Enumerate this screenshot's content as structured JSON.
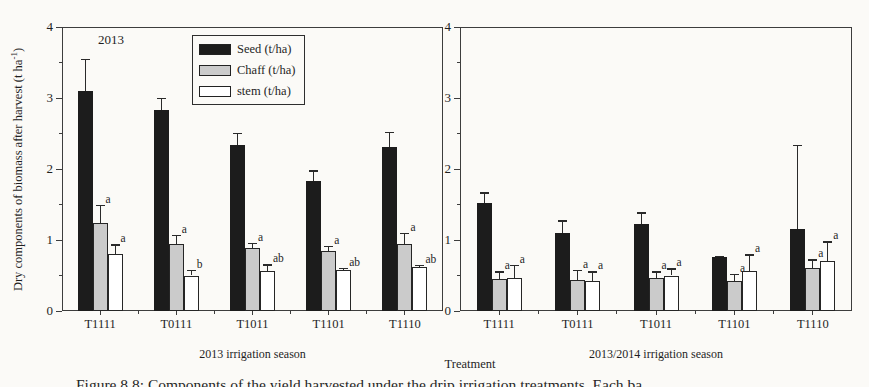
{
  "figure": {
    "background": "#fbfaf7",
    "axis_color": "#3d3d3d",
    "text_color": "#1f1f1f",
    "y_axis_label": {
      "pre": "Dry components of biomass after harvest (t ha",
      "sup": "-1",
      "post": ")"
    },
    "x_axis_label": "Treatment",
    "caption": "Figure 8.8: Components of the yield harvested under the drip irrigation treatments. Each ba",
    "legend": {
      "items": [
        {
          "key": "seed",
          "label": "Seed (t/ha)",
          "color": "#1c1c1c"
        },
        {
          "key": "chaff",
          "label": "Chaff (t/ha)",
          "color": "#cbcbcb"
        },
        {
          "key": "stem",
          "label": "stem (t/ha)",
          "color": "#ffffff"
        }
      ]
    }
  },
  "chart_data": [
    {
      "type": "bar",
      "panel": "left",
      "annotation": "2013",
      "season_label": "2013 irrigation season",
      "categories": [
        "T1111",
        "T0111",
        "T1011",
        "T1101",
        "T1110"
      ],
      "ylim": [
        0,
        4
      ],
      "yticks": [
        0,
        1,
        2,
        3,
        4
      ],
      "minor_ytick_step": 0.5,
      "grid": false,
      "series": [
        {
          "name": "Seed (t/ha)",
          "color": "#1c1c1c",
          "values": [
            3.1,
            2.83,
            2.34,
            1.83,
            2.31
          ],
          "errors": [
            0.45,
            0.17,
            0.17,
            0.15,
            0.21
          ],
          "letters": [
            "",
            "",
            "",
            "",
            ""
          ]
        },
        {
          "name": "Chaff (t/ha)",
          "color": "#cbcbcb",
          "values": [
            1.24,
            0.95,
            0.89,
            0.85,
            0.95
          ],
          "errors": [
            0.26,
            0.12,
            0.07,
            0.07,
            0.15
          ],
          "letters": [
            "a",
            "a",
            "a",
            "a",
            "a"
          ]
        },
        {
          "name": "stem (t/ha)",
          "color": "#ffffff",
          "values": [
            0.8,
            0.5,
            0.56,
            0.58,
            0.62
          ],
          "errors": [
            0.14,
            0.08,
            0.1,
            0.03,
            0.03
          ],
          "letters": [
            "a",
            "b",
            "ab",
            "ab",
            "ab"
          ]
        }
      ]
    },
    {
      "type": "bar",
      "panel": "right",
      "annotation": "",
      "season_label": "2013/2014 irrigation season",
      "categories": [
        "T1111",
        "T0111",
        "T1011",
        "T1101",
        "T1110"
      ],
      "ylim": [
        0,
        4
      ],
      "yticks": [
        0,
        1,
        2,
        3,
        4
      ],
      "minor_ytick_step": 0.5,
      "grid": false,
      "series": [
        {
          "name": "Seed (t/ha)",
          "color": "#1c1c1c",
          "values": [
            1.52,
            1.1,
            1.22,
            0.76,
            1.15
          ],
          "errors": [
            0.15,
            0.18,
            0.17,
            0.02,
            1.19
          ],
          "letters": [
            "",
            "",
            "",
            "",
            ""
          ]
        },
        {
          "name": "Chaff (t/ha)",
          "color": "#cbcbcb",
          "values": [
            0.45,
            0.44,
            0.47,
            0.42,
            0.61
          ],
          "errors": [
            0.11,
            0.14,
            0.09,
            0.1,
            0.12
          ],
          "letters": [
            "a",
            "a",
            "a",
            "a",
            "a"
          ]
        },
        {
          "name": "stem (t/ha)",
          "color": "#ffffff",
          "values": [
            0.47,
            0.42,
            0.5,
            0.57,
            0.7
          ],
          "errors": [
            0.18,
            0.14,
            0.1,
            0.23,
            0.28
          ],
          "letters": [
            "a",
            "a",
            "a",
            "a",
            "a"
          ]
        }
      ]
    }
  ]
}
